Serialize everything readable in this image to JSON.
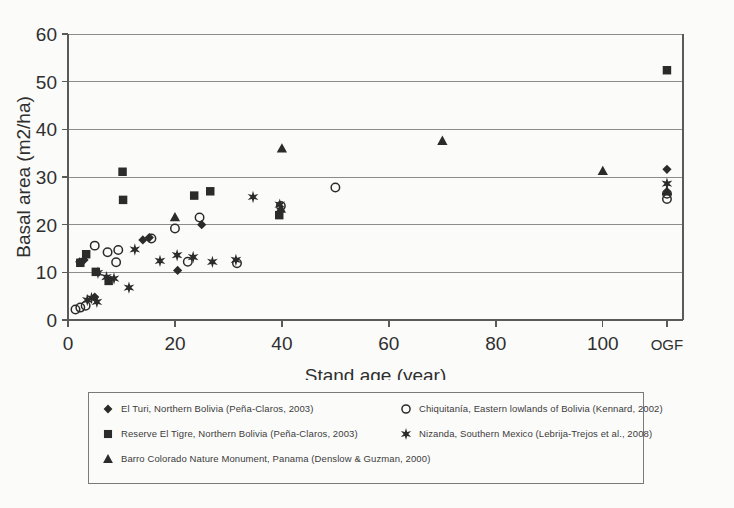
{
  "chart_data": {
    "type": "scatter",
    "title": "",
    "xlabel": "Stand age (year)",
    "ylabel": "Basal area (m2/ha)",
    "xlim": [
      0,
      115
    ],
    "ylim": [
      0,
      60
    ],
    "xticks": [
      0,
      20,
      40,
      60,
      80,
      100,
      112
    ],
    "xtick_labels": [
      "0",
      "20",
      "40",
      "60",
      "80",
      "100",
      "OGF"
    ],
    "yticks": [
      0,
      10,
      20,
      30,
      40,
      50,
      60
    ],
    "ytick_labels": [
      "0",
      "10",
      "20",
      "30",
      "40",
      "50",
      "60"
    ],
    "grid": "horizontal",
    "legend_position": "below-plot",
    "series": [
      {
        "name": "El Turi, Northern Bolivia (Peña-Claros, 2003)",
        "marker": "filled-diamond",
        "color": "#2b2b2b",
        "points": [
          [
            2.2,
            12.2
          ],
          [
            3.0,
            12.6
          ],
          [
            5.0,
            4.8
          ],
          [
            14.0,
            16.8
          ],
          [
            15.2,
            17.3
          ],
          [
            20.5,
            10.4
          ],
          [
            25.0,
            20.0
          ],
          [
            112.0,
            31.6
          ]
        ]
      },
      {
        "name": "Reserve El Tigre, Northern Bolivia (Peña-Claros, 2003)",
        "marker": "filled-square",
        "color": "#2b2b2b",
        "points": [
          [
            2.3,
            12.0
          ],
          [
            3.4,
            13.8
          ],
          [
            5.2,
            10.1
          ],
          [
            7.6,
            8.2
          ],
          [
            10.2,
            31.1
          ],
          [
            10.3,
            25.2
          ],
          [
            23.6,
            26.1
          ],
          [
            26.6,
            27.0
          ],
          [
            39.5,
            22.0
          ],
          [
            112.0,
            52.4
          ]
        ]
      },
      {
        "name": "Barro Colorado Nature Monument, Panama (Denslow & Guzman, 2000)",
        "marker": "filled-triangle",
        "color": "#2b2b2b",
        "points": [
          [
            20.0,
            21.6
          ],
          [
            39.8,
            23.4
          ],
          [
            40.0,
            36.0
          ],
          [
            70.0,
            37.6
          ],
          [
            100.0,
            31.3
          ],
          [
            112.0,
            27.1
          ]
        ]
      },
      {
        "name": "Chiquitanía, Eastern lowlands of Bolivia (Kennard, 2002)",
        "marker": "open-circle",
        "color": "#2b2b2b",
        "points": [
          [
            1.4,
            2.2
          ],
          [
            2.3,
            2.6
          ],
          [
            3.3,
            3.0
          ],
          [
            5.0,
            15.6
          ],
          [
            7.4,
            14.2
          ],
          [
            9.0,
            12.1
          ],
          [
            9.4,
            14.7
          ],
          [
            15.6,
            17.1
          ],
          [
            20.0,
            19.2
          ],
          [
            22.4,
            12.2
          ],
          [
            24.6,
            21.5
          ],
          [
            31.6,
            11.9
          ],
          [
            39.8,
            23.9
          ],
          [
            50.0,
            27.8
          ],
          [
            112.0,
            25.4
          ],
          [
            112.0,
            26.5
          ]
        ]
      },
      {
        "name": "Nizanda, Southern Mexico (Lebrija-Trejos et al., 2008)",
        "marker": "star",
        "color": "#2b2b2b",
        "points": [
          [
            3.6,
            4.2
          ],
          [
            4.4,
            4.6
          ],
          [
            5.4,
            3.8
          ],
          [
            5.6,
            9.9
          ],
          [
            7.2,
            9.0
          ],
          [
            8.6,
            8.7
          ],
          [
            11.4,
            6.8
          ],
          [
            12.5,
            14.8
          ],
          [
            17.2,
            12.4
          ],
          [
            20.4,
            13.6
          ],
          [
            23.4,
            13.2
          ],
          [
            27.0,
            12.2
          ],
          [
            31.4,
            12.6
          ],
          [
            34.6,
            25.8
          ],
          [
            39.6,
            24.2
          ],
          [
            112.0,
            28.6
          ]
        ]
      }
    ]
  },
  "legend": {
    "rows": [
      {
        "left": {
          "marker": "filled-diamond",
          "label": "El Turi, Northern Bolivia (Peña-Claros, 2003)"
        },
        "right": {
          "marker": "open-circle",
          "label": "Chiquitanía, Eastern lowlands of Bolivia (Kennard, 2002)"
        }
      },
      {
        "left": {
          "marker": "filled-square",
          "label": "Reserve El Tigre, Northern Bolivia (Peña-Claros, 2003)"
        },
        "right": {
          "marker": "star",
          "label": "Nizanda, Southern Mexico (Lebrija-Trejos et al., 2008)"
        }
      },
      {
        "left": {
          "marker": "filled-triangle",
          "label": "Barro Colorado Nature Monument, Panama (Denslow & Guzman, 2000)"
        },
        "right": null
      }
    ]
  },
  "style": {
    "ink": "#2b2b2b",
    "axis": "#5a5a5a",
    "grid": "#8c8c8c",
    "background": "#fbfbfa"
  }
}
